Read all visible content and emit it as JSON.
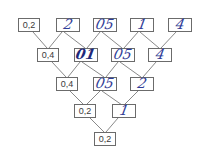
{
  "diagram": {
    "type": "number-pyramid",
    "rows": [
      {
        "cells": [
          {
            "value": "0,2",
            "style": "printed"
          },
          {
            "value": "2",
            "style": "handwritten"
          },
          {
            "value": "05",
            "style": "handwritten"
          },
          {
            "value": "1",
            "style": "handwritten"
          },
          {
            "value": "4",
            "style": "handwritten"
          }
        ]
      },
      {
        "cells": [
          {
            "value": "0,4",
            "style": "printed"
          },
          {
            "value": "01",
            "style": "handwritten"
          },
          {
            "value": "05",
            "style": "handwritten"
          },
          {
            "value": "4",
            "style": "handwritten"
          }
        ]
      },
      {
        "cells": [
          {
            "value": "0,4",
            "style": "printed"
          },
          {
            "value": "05",
            "style": "handwritten"
          },
          {
            "value": "2",
            "style": "handwritten"
          }
        ]
      },
      {
        "cells": [
          {
            "value": "0,2",
            "style": "printed"
          },
          {
            "value": "1",
            "style": "handwritten"
          }
        ]
      },
      {
        "cells": [
          {
            "value": "0,2",
            "style": "printed"
          }
        ]
      }
    ],
    "colors": {
      "line": "#6b6b6b",
      "printed_text": "#3a3a3a",
      "handwritten_ink": "#2f3c96"
    }
  }
}
